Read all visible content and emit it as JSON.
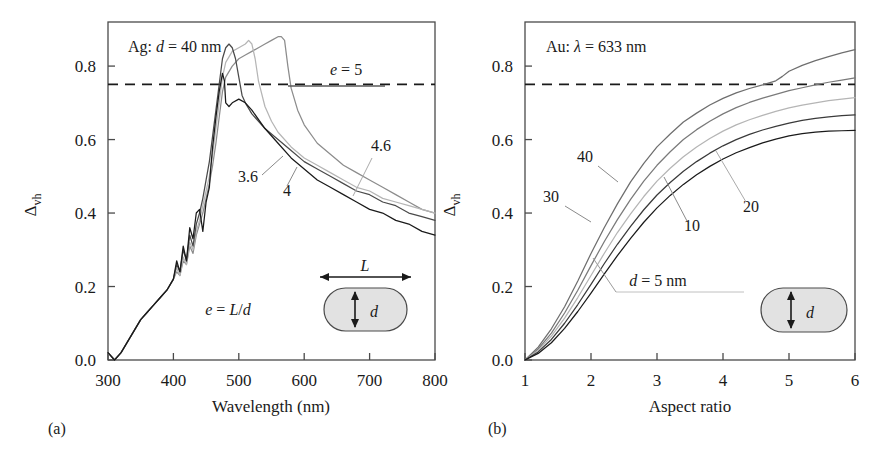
{
  "figure": {
    "background": "#ffffff",
    "ink": "#1a1a1a",
    "panels": [
      {
        "tag": "(a)"
      },
      {
        "tag": "(b)"
      }
    ]
  },
  "panel_a": {
    "tag": "(a)",
    "annotation_material": "Ag: ",
    "annotation_d_sym": "d",
    "annotation_d_val": " = 40 nm",
    "inset": {
      "L": "L",
      "d": "d",
      "relation_e": "e",
      "relation_eq": " = ",
      "relation_L": "L",
      "relation_slash": "/",
      "relation_d": "d"
    },
    "curve_labels": [
      {
        "text": "e = 5",
        "e_sym": "e",
        "rest": " = 5",
        "color": "#8c8c8c"
      },
      {
        "text": "4.6",
        "color": "#b5b5b5"
      },
      {
        "text": "4",
        "color": "#2b2b2b"
      },
      {
        "text": "3.6",
        "color": "#1a1a1a"
      }
    ],
    "yticks": [
      "0.0",
      "0.2",
      "0.4",
      "0.6",
      "0.8"
    ],
    "xticks": [
      "300",
      "400",
      "500",
      "600",
      "700",
      "800"
    ],
    "ylabel_delta": "Δ",
    "ylabel_sub": "vh",
    "xlabel": "Wavelength (nm)",
    "threshold_value": "0.75"
  },
  "panel_b": {
    "tag": "(b)",
    "annotation_material": "Au: ",
    "annotation_lambda": "λ",
    "annotation_rest": " = 633 nm",
    "inset": {
      "d": "d"
    },
    "curve_labels": [
      {
        "text": "40",
        "color": "#6e6e6e"
      },
      {
        "text": "30",
        "color": "#7a7a7a"
      },
      {
        "text": "20",
        "color": "#b5b5b5"
      },
      {
        "text": "10",
        "color": "#2b2b2b"
      },
      {
        "text": "d = 5 nm",
        "d_sym": "d",
        "rest": " = 5 nm",
        "color": "#1a1a1a"
      }
    ],
    "yticks": [
      "0.0",
      "0.2",
      "0.4",
      "0.6",
      "0.8"
    ],
    "xticks": [
      "1",
      "2",
      "3",
      "4",
      "5",
      "6"
    ],
    "ylabel_delta": "Δ",
    "ylabel_sub": "vh",
    "xlabel": "Aspect ratio",
    "threshold_value": "0.75"
  },
  "chart_data": [
    {
      "type": "line",
      "panel": "(a)",
      "title": "Ag: d = 40 nm",
      "xlabel": "Wavelength (nm)",
      "ylabel": "Δvh",
      "xlim": [
        300,
        800
      ],
      "ylim": [
        0.0,
        0.92
      ],
      "xticks": [
        300,
        400,
        500,
        600,
        700,
        800
      ],
      "yticks": [
        0.0,
        0.2,
        0.4,
        0.6,
        0.8
      ],
      "grid": false,
      "legend": "inline curve labels",
      "reference_line": {
        "y": 0.75,
        "style": "dashed"
      },
      "annotations": [
        "Ag: d = 40 nm",
        "e = L/d",
        "e = 5",
        "4.6",
        "4",
        "3.6"
      ],
      "series": [
        {
          "name": "e = 5",
          "color": "#8c8c8c",
          "x": [
            300,
            310,
            320,
            330,
            340,
            350,
            360,
            370,
            380,
            390,
            400,
            405,
            410,
            415,
            420,
            425,
            430,
            435,
            440,
            445,
            450,
            455,
            460,
            465,
            470,
            475,
            480,
            490,
            500,
            510,
            520,
            530,
            540,
            550,
            560,
            565,
            570,
            575,
            580,
            590,
            600,
            620,
            640,
            660,
            680,
            700,
            720,
            740,
            760,
            780,
            800
          ],
          "y": [
            0.02,
            0.0,
            0.02,
            0.05,
            0.08,
            0.11,
            0.13,
            0.15,
            0.17,
            0.19,
            0.22,
            0.24,
            0.23,
            0.27,
            0.26,
            0.31,
            0.29,
            0.34,
            0.37,
            0.4,
            0.44,
            0.48,
            0.53,
            0.59,
            0.66,
            0.73,
            0.77,
            0.8,
            0.82,
            0.83,
            0.84,
            0.85,
            0.86,
            0.87,
            0.88,
            0.88,
            0.87,
            0.8,
            0.74,
            0.68,
            0.64,
            0.59,
            0.56,
            0.53,
            0.51,
            0.49,
            0.47,
            0.45,
            0.43,
            0.41,
            0.4
          ]
        },
        {
          "name": "4.6",
          "color": "#b5b5b5",
          "x": [
            300,
            310,
            320,
            330,
            340,
            350,
            360,
            370,
            380,
            390,
            400,
            405,
            410,
            415,
            420,
            425,
            430,
            435,
            440,
            445,
            450,
            455,
            460,
            465,
            470,
            475,
            480,
            490,
            500,
            510,
            515,
            520,
            525,
            530,
            540,
            550,
            560,
            580,
            600,
            620,
            640,
            660,
            680,
            700,
            720,
            740,
            760,
            780,
            800
          ],
          "y": [
            0.02,
            0.0,
            0.02,
            0.05,
            0.08,
            0.11,
            0.13,
            0.15,
            0.17,
            0.19,
            0.22,
            0.25,
            0.23,
            0.28,
            0.26,
            0.32,
            0.3,
            0.35,
            0.38,
            0.42,
            0.46,
            0.5,
            0.56,
            0.63,
            0.7,
            0.77,
            0.81,
            0.84,
            0.85,
            0.86,
            0.87,
            0.86,
            0.82,
            0.76,
            0.69,
            0.65,
            0.62,
            0.58,
            0.55,
            0.53,
            0.51,
            0.49,
            0.47,
            0.46,
            0.44,
            0.43,
            0.42,
            0.41,
            0.4
          ]
        },
        {
          "name": "4",
          "color": "#4a4a4a",
          "x": [
            300,
            310,
            320,
            330,
            340,
            350,
            360,
            370,
            380,
            390,
            400,
            405,
            410,
            415,
            420,
            425,
            430,
            435,
            440,
            445,
            450,
            455,
            460,
            465,
            470,
            475,
            480,
            485,
            490,
            495,
            500,
            505,
            510,
            520,
            540,
            560,
            580,
            600,
            620,
            640,
            660,
            680,
            700,
            720,
            740,
            760,
            780,
            800
          ],
          "y": [
            0.02,
            0.0,
            0.02,
            0.05,
            0.08,
            0.11,
            0.13,
            0.15,
            0.17,
            0.19,
            0.22,
            0.26,
            0.24,
            0.3,
            0.27,
            0.34,
            0.31,
            0.37,
            0.4,
            0.44,
            0.49,
            0.54,
            0.61,
            0.68,
            0.75,
            0.82,
            0.85,
            0.86,
            0.85,
            0.82,
            0.77,
            0.72,
            0.7,
            0.67,
            0.63,
            0.6,
            0.57,
            0.54,
            0.52,
            0.5,
            0.48,
            0.46,
            0.45,
            0.43,
            0.42,
            0.4,
            0.39,
            0.38
          ]
        },
        {
          "name": "3.6",
          "color": "#1a1a1a",
          "x": [
            300,
            310,
            320,
            330,
            340,
            350,
            360,
            370,
            380,
            390,
            400,
            405,
            410,
            415,
            420,
            425,
            430,
            435,
            440,
            445,
            450,
            455,
            457,
            460,
            465,
            470,
            475,
            478,
            480,
            485,
            490,
            500,
            510,
            520,
            540,
            560,
            580,
            600,
            620,
            640,
            660,
            680,
            700,
            720,
            740,
            760,
            780,
            800
          ],
          "y": [
            0.02,
            0.0,
            0.02,
            0.05,
            0.08,
            0.11,
            0.13,
            0.15,
            0.17,
            0.19,
            0.22,
            0.27,
            0.24,
            0.31,
            0.27,
            0.36,
            0.33,
            0.4,
            0.41,
            0.35,
            0.43,
            0.47,
            0.52,
            0.58,
            0.66,
            0.73,
            0.78,
            0.76,
            0.7,
            0.69,
            0.7,
            0.71,
            0.7,
            0.68,
            0.63,
            0.59,
            0.55,
            0.52,
            0.49,
            0.47,
            0.45,
            0.43,
            0.41,
            0.4,
            0.38,
            0.37,
            0.35,
            0.34
          ]
        }
      ]
    },
    {
      "type": "line",
      "panel": "(b)",
      "title": "Au: λ = 633 nm",
      "xlabel": "Aspect ratio",
      "ylabel": "Δvh",
      "xlim": [
        1,
        6
      ],
      "ylim": [
        0.0,
        0.92
      ],
      "xticks": [
        1,
        2,
        3,
        4,
        5,
        6
      ],
      "yticks": [
        0.0,
        0.2,
        0.4,
        0.6,
        0.8
      ],
      "grid": false,
      "legend": "inline curve labels",
      "reference_line": {
        "y": 0.75,
        "style": "dashed"
      },
      "annotations": [
        "Au: λ = 633 nm",
        "40",
        "30",
        "20",
        "10",
        "d = 5 nm"
      ],
      "series": [
        {
          "name": "40",
          "color": "#6e6e6e",
          "x": [
            1.0,
            1.2,
            1.4,
            1.6,
            1.8,
            2.0,
            2.2,
            2.4,
            2.6,
            2.8,
            3.0,
            3.2,
            3.4,
            3.6,
            3.8,
            4.0,
            4.2,
            4.4,
            4.6,
            4.8,
            4.9,
            5.0,
            5.2,
            5.4,
            5.6,
            5.8,
            6.0
          ],
          "y": [
            0.0,
            0.035,
            0.085,
            0.145,
            0.215,
            0.29,
            0.36,
            0.425,
            0.485,
            0.535,
            0.58,
            0.615,
            0.648,
            0.672,
            0.694,
            0.712,
            0.727,
            0.739,
            0.749,
            0.76,
            0.772,
            0.786,
            0.802,
            0.815,
            0.826,
            0.836,
            0.845
          ]
        },
        {
          "name": "30",
          "color": "#7a7a7a",
          "x": [
            1.0,
            1.2,
            1.4,
            1.6,
            1.8,
            2.0,
            2.2,
            2.4,
            2.6,
            2.8,
            3.0,
            3.2,
            3.4,
            3.6,
            3.8,
            4.0,
            4.2,
            4.4,
            4.6,
            4.8,
            5.0,
            5.2,
            5.4,
            5.6,
            5.8,
            6.0
          ],
          "y": [
            0.0,
            0.03,
            0.073,
            0.128,
            0.19,
            0.257,
            0.322,
            0.382,
            0.437,
            0.487,
            0.53,
            0.567,
            0.6,
            0.627,
            0.65,
            0.67,
            0.687,
            0.701,
            0.713,
            0.723,
            0.733,
            0.741,
            0.749,
            0.756,
            0.762,
            0.768
          ]
        },
        {
          "name": "20",
          "color": "#b5b5b5",
          "x": [
            1.0,
            1.2,
            1.4,
            1.6,
            1.8,
            2.0,
            2.2,
            2.4,
            2.6,
            2.8,
            3.0,
            3.2,
            3.4,
            3.6,
            3.8,
            4.0,
            4.2,
            4.4,
            4.6,
            4.8,
            5.0,
            5.2,
            5.4,
            5.6,
            5.8,
            6.0
          ],
          "y": [
            0.0,
            0.026,
            0.065,
            0.114,
            0.17,
            0.23,
            0.29,
            0.347,
            0.398,
            0.445,
            0.487,
            0.522,
            0.553,
            0.58,
            0.603,
            0.623,
            0.64,
            0.654,
            0.666,
            0.677,
            0.686,
            0.694,
            0.7,
            0.706,
            0.71,
            0.714
          ]
        },
        {
          "name": "10",
          "color": "#3a3a3a",
          "x": [
            1.0,
            1.2,
            1.4,
            1.6,
            1.8,
            2.0,
            2.2,
            2.4,
            2.6,
            2.8,
            3.0,
            3.2,
            3.4,
            3.6,
            3.8,
            4.0,
            4.2,
            4.4,
            4.6,
            4.8,
            5.0,
            5.2,
            5.4,
            5.6,
            5.8,
            6.0
          ],
          "y": [
            0.0,
            0.022,
            0.056,
            0.1,
            0.151,
            0.206,
            0.262,
            0.315,
            0.364,
            0.409,
            0.449,
            0.483,
            0.514,
            0.54,
            0.563,
            0.583,
            0.6,
            0.614,
            0.626,
            0.636,
            0.645,
            0.652,
            0.658,
            0.662,
            0.665,
            0.667
          ]
        },
        {
          "name": "d = 5 nm",
          "color": "#1a1a1a",
          "x": [
            1.0,
            1.2,
            1.4,
            1.6,
            1.8,
            2.0,
            2.2,
            2.4,
            2.6,
            2.8,
            3.0,
            3.2,
            3.4,
            3.6,
            3.8,
            4.0,
            4.2,
            4.4,
            4.6,
            4.8,
            5.0,
            5.2,
            5.4,
            5.6,
            5.8,
            6.0
          ],
          "y": [
            0.0,
            0.018,
            0.047,
            0.086,
            0.132,
            0.182,
            0.234,
            0.284,
            0.331,
            0.375,
            0.414,
            0.448,
            0.478,
            0.504,
            0.527,
            0.547,
            0.564,
            0.578,
            0.591,
            0.601,
            0.61,
            0.616,
            0.62,
            0.623,
            0.624,
            0.625
          ]
        }
      ]
    }
  ]
}
